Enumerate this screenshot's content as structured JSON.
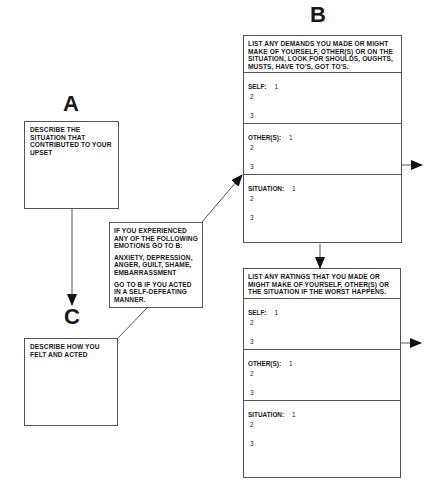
{
  "labels": {
    "a": "A",
    "b": "B",
    "c": "C"
  },
  "box_a": {
    "text": "DESCRIBE THE SITUATION THAT CONTRIBUTED TO YOUR UPSET"
  },
  "box_c": {
    "text": "DESCRIBE HOW YOU FELT AND ACTED"
  },
  "emotions_box": {
    "line1": "IF YOU EXPERIENCED ANY OF THE FOLLOWING EMOTIONS GO TO B:",
    "line2": "ANXIETY, DEPRESSION, ANGER, GUILT, SHAME, EMBARRASSMENT",
    "line3": "GO TO B IF YOU ACTED IN A SELF-DEFEATING MANNER."
  },
  "demands_box": {
    "header": "LIST ANY DEMANDS YOU MADE OR MIGHT MAKE OF YOURSELF, OTHER(S) OR ON THE SITUATION, LOOK FOR SHOULDS, OUGHTS, MUSTS, HAVE TO'S, GOT TO'S.",
    "sections": [
      {
        "label": "SELF:",
        "items": [
          "1",
          "2",
          "3"
        ]
      },
      {
        "label": "OTHER(S):",
        "items": [
          "1",
          "2",
          "3"
        ]
      },
      {
        "label": "SITUATION:",
        "items": [
          "1",
          "2",
          "3"
        ]
      }
    ]
  },
  "ratings_box": {
    "header": "LIST ANY RATINGS THAT YOU MADE OR MIGHT MAKE OF YOURSELF, OTHER(S) OR THE SITUATION IF THE WORST HAPPENS.",
    "sections": [
      {
        "label": "SELF:",
        "items": [
          "1",
          "2",
          "3"
        ]
      },
      {
        "label": "OTHER(S):",
        "items": [
          "1",
          "2",
          "3"
        ]
      },
      {
        "label": "SITUATION:",
        "items": [
          "1",
          "2",
          "3"
        ]
      }
    ]
  },
  "colors": {
    "line": "#555555",
    "text": "#1a1a1a",
    "background": "#ffffff"
  }
}
